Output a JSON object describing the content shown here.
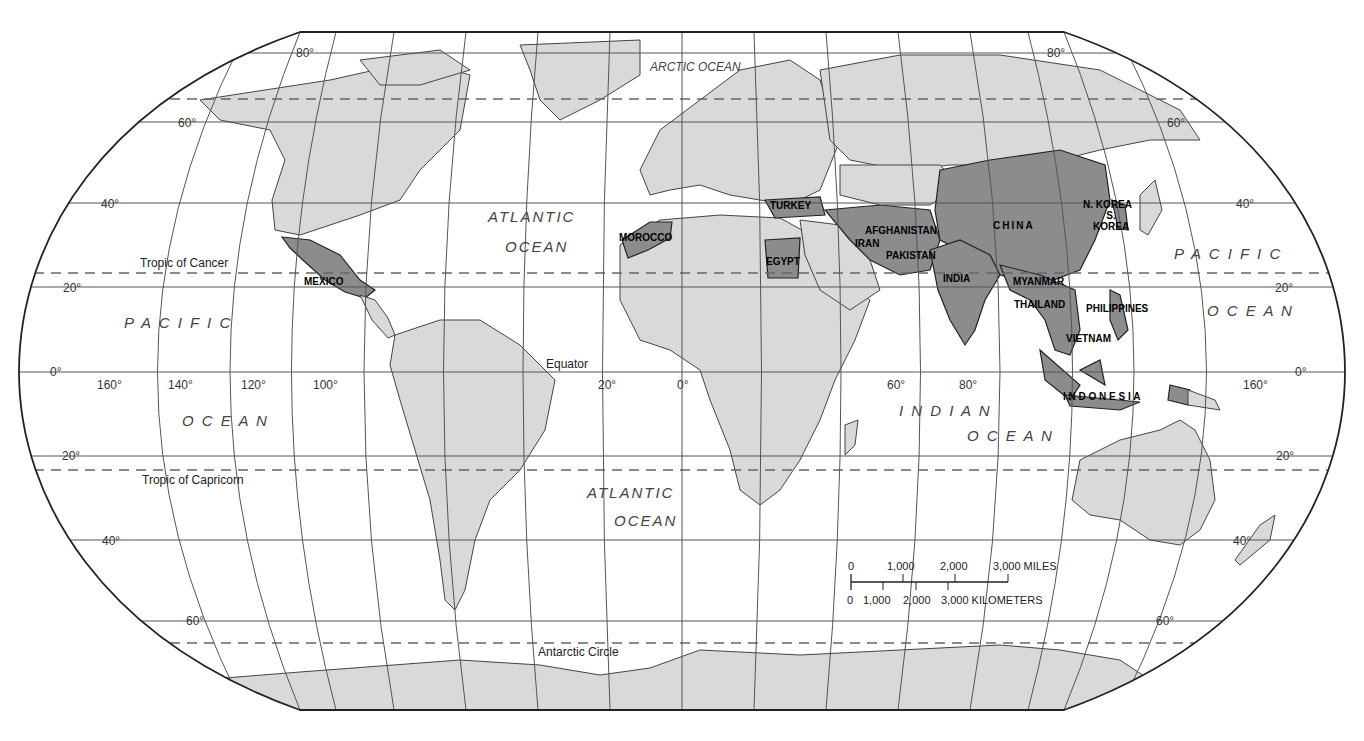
{
  "map": {
    "projection_style": "Robinson-style world map",
    "colors": {
      "land": "#d9d9d9",
      "highlight": "#8c8c8c",
      "border": "#444444",
      "ocean": "#ffffff"
    },
    "oceans": {
      "arctic": "ARCTIC OCEAN",
      "atlantic_north_1": "ATLANTIC",
      "atlantic_north_2": "OCEAN",
      "atlantic_south_1": "ATLANTIC",
      "atlantic_south_2": "OCEAN",
      "pacific_west_1": "P A C I F I C",
      "pacific_west_2": "O C E A N",
      "pacific_east_1": "P A C I F I C",
      "pacific_east_2": "O C E A N",
      "indian_1": "I N D I A N",
      "indian_2": "O C E A N"
    },
    "lines": {
      "tropic_cancer": "Tropic of Cancer",
      "tropic_capricorn": "Tropic of Capricorn",
      "equator": "Equator",
      "antarctic_circle": "Antarctic Circle"
    },
    "highlighted_countries": [
      "MEXICO",
      "MOROCCO",
      "TURKEY",
      "EGYPT",
      "IRAN",
      "AFGHANISTAN",
      "PAKISTAN",
      "INDIA",
      "CHINA",
      "N. KOREA",
      "S. KOREA",
      "MYANMAR",
      "THAILAND",
      "VIETNAM",
      "PHILIPPINES",
      "I N D O N E S I A"
    ],
    "latitude_labels": {
      "n80_left": "80°",
      "n80_right": "80°",
      "n60_left": "60°",
      "n60_right": "60°",
      "n40_left": "40°",
      "n40_right": "40°",
      "n20_left": "20°",
      "n20_right": "20°",
      "eq_left": "0°",
      "eq_right": "0°",
      "s20_left": "20°",
      "s20_right": "20°",
      "s40_left": "40°",
      "s40_right": "40°",
      "s60_left": "60°",
      "s60_right": "60°"
    },
    "longitude_labels": [
      "160°",
      "140°",
      "120°",
      "100°",
      "20°",
      "0°",
      "60°",
      "80°",
      "160°"
    ],
    "scale_bar": {
      "miles": [
        "0",
        "1,000",
        "2,000",
        "3,000 MILES"
      ],
      "kilometers": [
        "0",
        "1,000",
        "2,000",
        "3,000 KILOMETERS"
      ]
    }
  }
}
